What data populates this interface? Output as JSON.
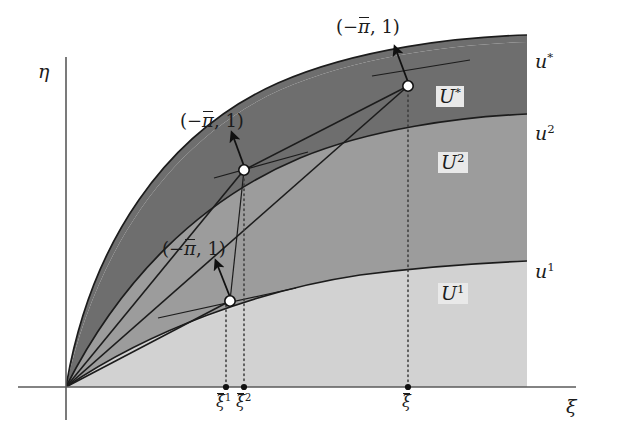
{
  "figure": {
    "kind": "phase-plane-diagram",
    "background": "#ffffff",
    "width": 626,
    "height": 435
  },
  "axes": {
    "x_label": "ξ",
    "y_label": "η",
    "origin": {
      "x": 66,
      "y": 387
    },
    "x_axis_end": {
      "x": 576,
      "y": 387
    },
    "y_axis_top": {
      "x": 66,
      "y": 57
    },
    "y_axis_bottom": {
      "x": 66,
      "y": 420
    },
    "axis_color": "#5a5a5a",
    "x_label_pos": {
      "x": 566,
      "y": 397
    },
    "y_label_pos": {
      "x": 38,
      "y": 62
    }
  },
  "ticks": [
    {
      "id": "xi-bar-1",
      "base": "ξ",
      "sup": "1",
      "x": 226,
      "label_x": 216,
      "label_y": 394
    },
    {
      "id": "xi-bar-2",
      "base": "ξ",
      "sup": "2",
      "x": 244,
      "label_x": 236,
      "label_y": 394
    },
    {
      "id": "xi-bar",
      "base": "ξ",
      "sup": "",
      "x": 408,
      "label_x": 402,
      "label_y": 394
    }
  ],
  "curves": [
    {
      "id": "u-star",
      "label": "u",
      "sup": "*",
      "label_x": 535,
      "label_y": 52
    },
    {
      "id": "u-2",
      "label": "u",
      "sup": "2",
      "label_x": 535,
      "label_y": 124
    },
    {
      "id": "u-1",
      "label": "u",
      "sup": "1",
      "label_x": 535,
      "label_y": 262
    }
  ],
  "regions": [
    {
      "id": "U-star",
      "label": "U",
      "sup": "*",
      "fill": "#6e6e6e",
      "label_x": 436,
      "label_y": 86
    },
    {
      "id": "U-2",
      "label": "U",
      "sup": "2",
      "fill": "#9c9c9c",
      "label_x": 438,
      "label_y": 152
    },
    {
      "id": "U-1",
      "label": "U",
      "sup": "1",
      "fill": "#d2d2d2",
      "label_x": 438,
      "label_y": 283
    }
  ],
  "annotations": [
    {
      "id": "annot-top",
      "text_prefix": "(−",
      "text_bar": "π",
      "text_suffix": ", 1)",
      "label_x": 336,
      "label_y": 18,
      "arrow_from": {
        "x": 408,
        "y": 86
      },
      "arrow_to": {
        "x": 394,
        "y": 52
      }
    },
    {
      "id": "annot-middle",
      "text_prefix": "(−",
      "text_bar": "π",
      "text_suffix": ", 1)",
      "label_x": 180,
      "label_y": 112,
      "arrow_from": {
        "x": 244,
        "y": 170
      },
      "arrow_to": {
        "x": 232,
        "y": 140
      }
    },
    {
      "id": "annot-bottom",
      "text_prefix": "(−",
      "text_bar": "π",
      "text_suffix": ", 1)",
      "label_x": 162,
      "label_y": 240,
      "arrow_from": {
        "x": 230,
        "y": 301
      },
      "arrow_to": {
        "x": 216,
        "y": 268
      }
    }
  ],
  "nodes": [
    {
      "id": "node-top",
      "x": 408,
      "y": 86
    },
    {
      "id": "node-middle",
      "x": 244,
      "y": 170
    },
    {
      "id": "node-bottom",
      "x": 230,
      "y": 301
    }
  ],
  "colors": {
    "dark_band": "#6e6e6e",
    "mid_band": "#9c9c9c",
    "light_band": "#d2d2d2",
    "curve_stroke": "#1c1c1c",
    "axis": "#5a5a5a",
    "node_fill": "#ffffff",
    "label_backing": "#e9e9e9"
  }
}
